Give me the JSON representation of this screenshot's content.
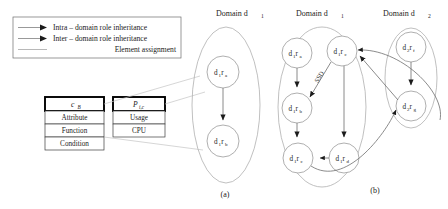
{
  "figure": {
    "caption_a": "(a)",
    "caption_b": "(b)"
  },
  "legend": {
    "items": [
      {
        "icon": "arrow-right-icon",
        "label": "Intra – domain role inheritance"
      },
      {
        "icon": "arrow-right-icon",
        "label": "Inter – domain role inheritance"
      },
      {
        "icon": "plain-line-icon",
        "label": "Element assignment"
      }
    ]
  },
  "tables": {
    "class_table": {
      "header": "c",
      "header_sub": "B",
      "rows": [
        "Attribute",
        "Function",
        "Condition"
      ]
    },
    "permission_table": {
      "header": "P",
      "header_sub": "i,c",
      "rows": [
        "Usage",
        "CPU"
      ]
    }
  },
  "diagram_a": {
    "domain_title": "Domain d",
    "domain_title_sub": "1",
    "nodes": [
      {
        "id": "a-ra",
        "label": "d",
        "sub1": "1",
        "label2": "r",
        "sub2": "a"
      },
      {
        "id": "a-rb",
        "label": "d",
        "sub1": "1",
        "label2": "r",
        "sub2": "b"
      }
    ],
    "edges": [
      {
        "from": "a-ra",
        "to": "a-rb",
        "type": "intra-domain"
      }
    ]
  },
  "diagram_b": {
    "domain1_title": "Domain d",
    "domain1_title_sub": "1",
    "domain2_title": "Domain d",
    "domain2_title_sub": "2",
    "ssd_label": "SSD",
    "nodes_domain1": [
      {
        "id": "b-ra",
        "label": "d",
        "sub1": "1",
        "label2": "r",
        "sub2": "a"
      },
      {
        "id": "b-rc2",
        "label": "d",
        "sub1": "1",
        "label2": "r",
        "sub2": "c"
      },
      {
        "id": "b-rb",
        "label": "d",
        "sub1": "1",
        "label2": "r",
        "sub2": "b"
      },
      {
        "id": "b-rc",
        "label": "d",
        "sub1": "1",
        "label2": "r",
        "sub2": "c"
      },
      {
        "id": "b-rd",
        "label": "d",
        "sub1": "1",
        "label2": "r",
        "sub2": "d"
      }
    ],
    "nodes_domain2": [
      {
        "id": "b-rf",
        "label": "d",
        "sub1": "2",
        "label2": "r",
        "sub2": "f"
      },
      {
        "id": "b-rg",
        "label": "d",
        "sub1": "2",
        "label2": "r",
        "sub2": "g"
      }
    ],
    "edges": [
      {
        "from": "b-ra",
        "to": "b-rb",
        "type": "intra-domain"
      },
      {
        "from": "b-rc2",
        "to": "b-rb",
        "type": "ssd"
      },
      {
        "from": "b-rb",
        "to": "b-rc",
        "type": "intra-domain"
      },
      {
        "from": "b-rc2",
        "to": "b-rd",
        "type": "intra-domain"
      },
      {
        "from": "b-rd",
        "to": "b-rc",
        "type": "intra-domain"
      },
      {
        "from": "b-rf",
        "to": "b-rg",
        "type": "intra-domain"
      },
      {
        "from": "b-rg",
        "to": "b-rc2",
        "type": "inter-domain"
      },
      {
        "from": "b-rc",
        "to": "b-rg",
        "type": "inter-domain"
      }
    ]
  },
  "colors": {
    "stroke": "#4a4a4a",
    "text": "#1b1b1b",
    "box_border": "#000000",
    "ellipse_stroke": "#9a9a9a"
  }
}
